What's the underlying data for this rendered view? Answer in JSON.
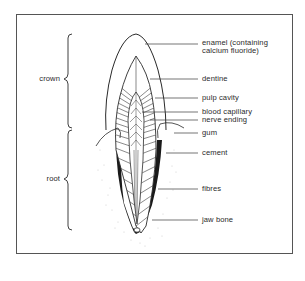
{
  "diagram": {
    "regions": {
      "crown": "crown",
      "root": "root"
    },
    "labels": [
      {
        "id": "enamel",
        "line1": "enamel (containing",
        "line2": "calcium fluoride)"
      },
      {
        "id": "dentine",
        "line1": "dentine"
      },
      {
        "id": "pulp_cavity",
        "line1": "pulp cavity"
      },
      {
        "id": "blood_capillary",
        "line1": "blood capillary"
      },
      {
        "id": "nerve_ending",
        "line1": "nerve ending"
      },
      {
        "id": "gum",
        "line1": "gum"
      },
      {
        "id": "cement",
        "line1": "cement"
      },
      {
        "id": "fibres",
        "line1": "fibres"
      },
      {
        "id": "jaw_bone",
        "line1": "jaw bone"
      }
    ],
    "colors": {
      "line": "#2a2a2a",
      "frame": "#555555",
      "cement_fill": "#1a1a1a",
      "background": "#ffffff"
    }
  }
}
